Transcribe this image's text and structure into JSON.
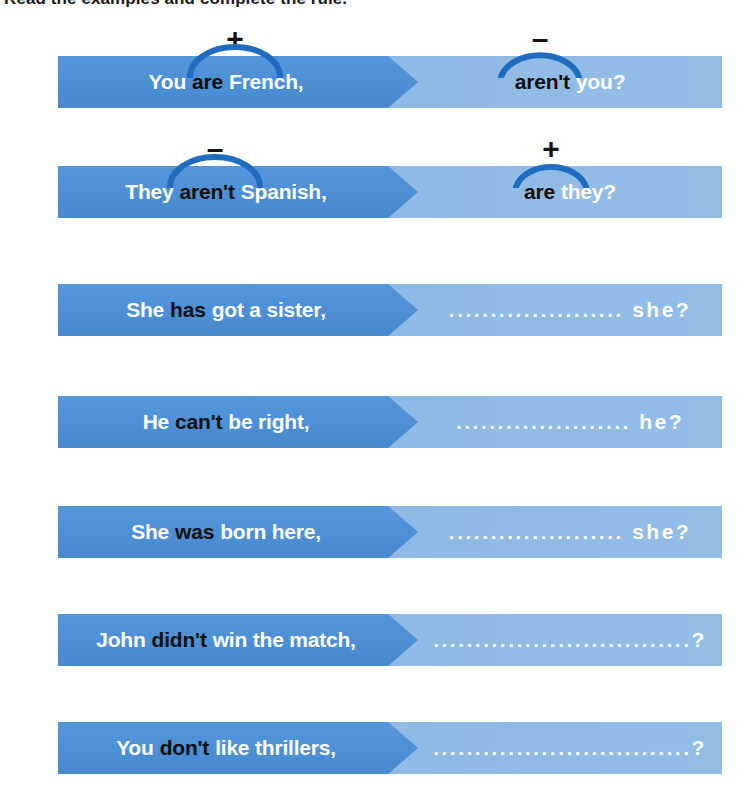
{
  "instruction": "Read the examples and complete the rule.",
  "colors": {
    "bar_left": "#4a90d9",
    "bar_right": "#8cb8e4",
    "arc": "#1f6cc0",
    "text_white": "#ffffff",
    "text_black": "#111111",
    "page_background": "#ffffff"
  },
  "blank_dots": "...........................",
  "rows": [
    {
      "id": "row-1",
      "statement": {
        "pre": "You",
        "aux": "are",
        "post": "French,"
      },
      "tag": {
        "aux": "aren't",
        "post": "you?"
      },
      "statement_sign": "+",
      "tag_sign": "–",
      "has_markers": true,
      "has_blank": false
    },
    {
      "id": "row-2",
      "statement": {
        "pre": "They",
        "aux": "aren't",
        "post": "Spanish,"
      },
      "tag": {
        "aux": "are",
        "post": "they?"
      },
      "statement_sign": "–",
      "tag_sign": "+",
      "has_markers": true,
      "has_blank": false
    },
    {
      "id": "row-3",
      "statement": {
        "pre": "She",
        "aux": "has",
        "post": "got a sister,"
      },
      "tag": {
        "aux": "",
        "post": "she?"
      },
      "statement_sign": "",
      "tag_sign": "",
      "has_markers": false,
      "has_blank": true,
      "blank": "..................... she?"
    },
    {
      "id": "row-4",
      "statement": {
        "pre": "He",
        "aux": "can't",
        "post": "be right,"
      },
      "tag": {
        "aux": "",
        "post": "he?"
      },
      "statement_sign": "",
      "tag_sign": "",
      "has_markers": false,
      "has_blank": true,
      "blank": "..................... he?"
    },
    {
      "id": "row-5",
      "statement": {
        "pre": "She",
        "aux": "was",
        "post": "born here,"
      },
      "tag": {
        "aux": "",
        "post": "she?"
      },
      "statement_sign": "",
      "tag_sign": "",
      "has_markers": false,
      "has_blank": true,
      "blank": "..................... she?"
    },
    {
      "id": "row-6",
      "statement": {
        "pre": "John",
        "aux": "didn't",
        "post": "win the match,"
      },
      "tag": {
        "aux": "",
        "post": "?"
      },
      "statement_sign": "",
      "tag_sign": "",
      "has_markers": false,
      "has_blank": true,
      "blank": "...............................?"
    },
    {
      "id": "row-7",
      "statement": {
        "pre": "You",
        "aux": "don't",
        "post": "like thrillers,"
      },
      "tag": {
        "aux": "",
        "post": "?"
      },
      "statement_sign": "",
      "tag_sign": "",
      "has_markers": false,
      "has_blank": true,
      "blank": "...............................?"
    }
  ]
}
